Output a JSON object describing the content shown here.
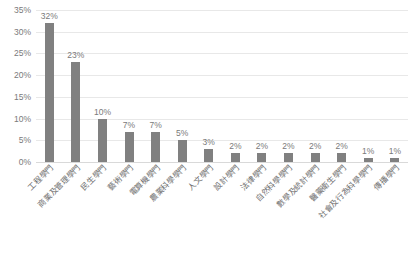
{
  "chart_data": {
    "type": "bar",
    "title": "",
    "subtitle": "",
    "xlabel": "",
    "ylabel": "",
    "ylim": [
      0,
      35
    ],
    "ytick_labels": [
      "35%",
      "30%",
      "25%",
      "20%",
      "15%",
      "10%",
      "5%",
      "0%"
    ],
    "ytick_values": [
      35,
      30,
      25,
      20,
      15,
      10,
      5,
      0
    ],
    "grid": true,
    "legend": false,
    "legend_position": "none",
    "categories": [
      "工程學門",
      "商業及管理學門",
      "民生學門",
      "藝術學門",
      "電算機學門",
      "農業科學學門",
      "人文學門",
      "設計學門",
      "法律學門",
      "自然科學學門",
      "數學及統計學門",
      "醫藥衛生學門",
      "社會及行為科學學門",
      "傳播學門"
    ],
    "values": [
      32,
      23,
      10,
      7,
      7,
      5,
      3,
      2,
      2,
      2,
      2,
      2,
      1,
      1
    ],
    "data_labels": [
      "32%",
      "23%",
      "10%",
      "7%",
      "7%",
      "5%",
      "3%",
      "2%",
      "2%",
      "2%",
      "2%",
      "2%",
      "1%",
      "1%"
    ],
    "bar_color": "#808080",
    "gridline_color": "#e8e8e8",
    "text_color": "#7a7a7a",
    "background_color": "#ffffff"
  }
}
